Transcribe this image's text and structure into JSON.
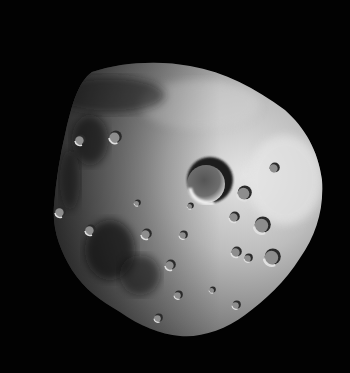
{
  "image": {
    "subject": "cratered irregular moon",
    "width": 350,
    "height": 373,
    "background_color": "#020202",
    "body_colors": {
      "lit": "#d8d8d8",
      "mid": "#9a9a9a",
      "shadow": "#2a2a2a"
    },
    "large_crater": {
      "cx": 208,
      "cy": 180,
      "r": 22
    },
    "small_craters": [
      {
        "cx": 244,
        "cy": 193,
        "r": 7
      },
      {
        "cx": 262,
        "cy": 225,
        "r": 8
      },
      {
        "cx": 234,
        "cy": 217,
        "r": 5
      },
      {
        "cx": 236,
        "cy": 252,
        "r": 5
      },
      {
        "cx": 248,
        "cy": 258,
        "r": 4
      },
      {
        "cx": 272,
        "cy": 257,
        "r": 8
      },
      {
        "cx": 274,
        "cy": 168,
        "r": 5
      },
      {
        "cx": 90,
        "cy": 230,
        "r": 5
      },
      {
        "cx": 115,
        "cy": 137,
        "r": 6
      },
      {
        "cx": 146,
        "cy": 234,
        "r": 5
      },
      {
        "cx": 183,
        "cy": 235,
        "r": 4
      },
      {
        "cx": 170,
        "cy": 265,
        "r": 5
      },
      {
        "cx": 178,
        "cy": 295,
        "r": 4
      },
      {
        "cx": 158,
        "cy": 318,
        "r": 4
      },
      {
        "cx": 236,
        "cy": 305,
        "r": 4
      },
      {
        "cx": 212,
        "cy": 290,
        "r": 3
      },
      {
        "cx": 60,
        "cy": 212,
        "r": 5
      },
      {
        "cx": 137,
        "cy": 203,
        "r": 3
      },
      {
        "cx": 190,
        "cy": 206,
        "r": 3
      },
      {
        "cx": 80,
        "cy": 140,
        "r": 5
      }
    ]
  }
}
